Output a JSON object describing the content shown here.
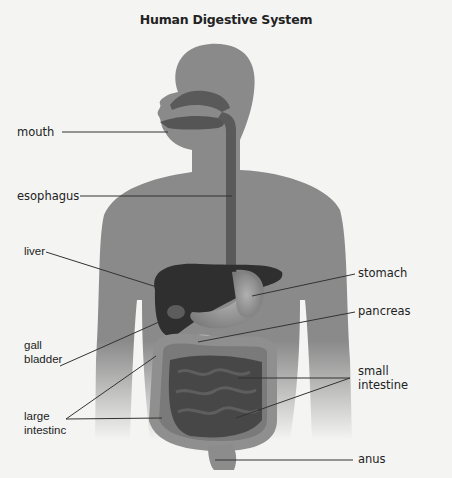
{
  "title": "Human Digestive System",
  "labels": {
    "mouth": "mouth",
    "esophagus": "esophagus",
    "liver": "liver",
    "gall_bladder_1": "gall",
    "gall_bladder_2": "bladder",
    "large_intestine_1": "large",
    "large_intestine_2": "intestinc",
    "stomach": "stomach",
    "pancreas": "pancreas",
    "small_intestine_1": "small",
    "small_intestine_2": "intestine",
    "anus": "anus"
  },
  "colors": {
    "background": "#f4f4f3",
    "body": "#8a8a8a",
    "organ_dark": "#3a3a3a",
    "organ_mid": "#6e6e6e",
    "organ_light": "#9c9c9c",
    "line": "#333333"
  }
}
